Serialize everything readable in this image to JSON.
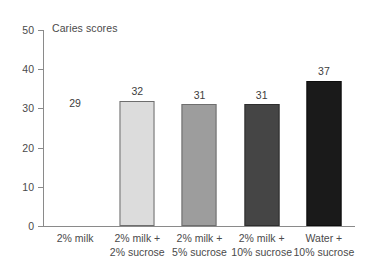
{
  "chart_data": {
    "type": "bar",
    "title": "Caries scores",
    "xlabel": "",
    "ylabel": "",
    "ylim": [
      0,
      50
    ],
    "yticks": [
      0,
      10,
      20,
      30,
      40,
      50
    ],
    "ytick_labels": [
      "0",
      "10",
      "20",
      "30",
      "40",
      "50"
    ],
    "grid": false,
    "legend": "none",
    "categories": [
      "2% milk",
      "2% milk + 2% sucrose",
      "2% milk + 5% sucrose",
      "2% milk + 10% sucrose",
      "Water + 10% sucrose"
    ],
    "category_lines": [
      {
        "line1": "2% milk",
        "line2": ""
      },
      {
        "line1": "2% milk +",
        "line2": "2% sucrose"
      },
      {
        "line1": "2% milk +",
        "line2": "5% sucrose"
      },
      {
        "line1": "2% milk +",
        "line2": "10% sucrose"
      },
      {
        "line1": "Water +",
        "line2": "10% sucrose"
      }
    ],
    "values": [
      29,
      32,
      31,
      31,
      37
    ],
    "value_labels": [
      "29",
      "32",
      "31",
      "31",
      "37"
    ],
    "bar_colors": [
      "#ffffff",
      "#dcdcdc",
      "#9d9d9d",
      "#454545",
      "#1a1a1a"
    ],
    "bar_borders": [
      "none",
      "#6e6e6e",
      "#6e6e6e",
      "#2e2e2e",
      "#0d0d0d"
    ],
    "bars_drawn": [
      false,
      true,
      true,
      true,
      true
    ]
  }
}
